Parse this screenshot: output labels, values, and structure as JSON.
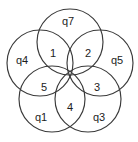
{
  "figure": {
    "type": "venn-rosette",
    "circle_count": 5,
    "stroke_color": "#3a3a3a",
    "background_color": "#ffffff",
    "text_color": "#1c1c1c",
    "center_point": {
      "x": 70,
      "y": 73
    },
    "circle_radius": 33,
    "center_offset": 31
  },
  "petals": [
    {
      "id": "petal-1",
      "label": "1",
      "x": 53,
      "y": 54,
      "position": "upper-left"
    },
    {
      "id": "petal-2",
      "label": "2",
      "x": 88,
      "y": 54,
      "position": "upper-right"
    },
    {
      "id": "petal-3",
      "label": "3",
      "x": 97,
      "y": 88,
      "position": "right-lower"
    },
    {
      "id": "petal-4",
      "label": "4",
      "x": 70,
      "y": 108,
      "position": "bottom"
    },
    {
      "id": "petal-5",
      "label": "5",
      "x": 44,
      "y": 88,
      "position": "left-lower"
    }
  ],
  "outer_regions": [
    {
      "id": "outer-q7",
      "label": "q7",
      "x": 68,
      "y": 22,
      "position": "top"
    },
    {
      "id": "outer-q5",
      "label": "q5",
      "x": 117,
      "y": 61,
      "position": "right"
    },
    {
      "id": "outer-q3",
      "label": "q3",
      "x": 99,
      "y": 118,
      "position": "bottom-right"
    },
    {
      "id": "outer-q1",
      "label": "q1",
      "x": 41,
      "y": 118,
      "position": "bottom-left"
    },
    {
      "id": "outer-q4",
      "label": "q4",
      "x": 22,
      "y": 61,
      "position": "left"
    }
  ],
  "circles": [
    {
      "id": "circle-top",
      "cx": 70,
      "cy": 42,
      "r": 33
    },
    {
      "id": "circle-right",
      "cx": 100,
      "cy": 63,
      "r": 33
    },
    {
      "id": "circle-bottom-right",
      "cx": 88,
      "cy": 99,
      "r": 33
    },
    {
      "id": "circle-bottom-left",
      "cx": 52,
      "cy": 99,
      "r": 33
    },
    {
      "id": "circle-left",
      "cx": 40,
      "cy": 63,
      "r": 33
    }
  ]
}
